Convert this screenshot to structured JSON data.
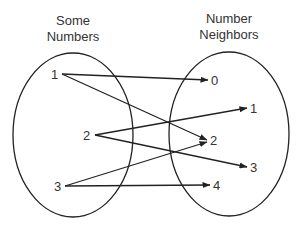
{
  "diagram": {
    "type": "mapping",
    "left_set": {
      "title_line1": "Some",
      "title_line2": "Numbers",
      "elements": [
        "1",
        "2",
        "3"
      ]
    },
    "right_set": {
      "title_line1": "Number",
      "title_line2": "Neighbors",
      "elements": [
        "0",
        "1",
        "2",
        "3",
        "4"
      ]
    },
    "mappings": [
      {
        "from": "1",
        "to": "0"
      },
      {
        "from": "1",
        "to": "2"
      },
      {
        "from": "2",
        "to": "1"
      },
      {
        "from": "2",
        "to": "3"
      },
      {
        "from": "3",
        "to": "2"
      },
      {
        "from": "3",
        "to": "4"
      }
    ],
    "colors": {
      "stroke": "#222222",
      "text": "#333333",
      "background": "#ffffff"
    }
  }
}
